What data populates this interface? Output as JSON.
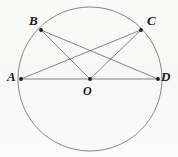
{
  "figure": {
    "kind": "geometry-diagram",
    "width": 178,
    "height": 157,
    "background_color": "#fbfbfa",
    "stroke_color": "#6e6e72",
    "point_color": "#1a1a1d",
    "label_color": "#17171a"
  },
  "labels": {
    "A": "A",
    "B": "B",
    "C": "C",
    "D": "D",
    "O": "O"
  },
  "chart_data": {
    "type": "diagram",
    "title": "",
    "shape": "circle",
    "circle": {
      "center": {
        "x": 90,
        "y": 79
      },
      "radius": 72,
      "cx": 90,
      "cy": 79,
      "r": 72
    },
    "points": [
      {
        "name": "A",
        "x": 21,
        "y": 79,
        "label_dx": -14,
        "label_dy": -9,
        "on_circle": true
      },
      {
        "name": "B",
        "x": 41,
        "y": 30,
        "label_dx": -12,
        "label_dy": -16,
        "on_circle": true
      },
      {
        "name": "C",
        "x": 141,
        "y": 30,
        "label_dx": 6,
        "label_dy": -16,
        "on_circle": true
      },
      {
        "name": "D",
        "x": 158,
        "y": 79,
        "label_dx": 3,
        "label_dy": -9,
        "on_circle": true
      },
      {
        "name": "O",
        "x": 90,
        "y": 79,
        "label_dx": -7,
        "label_dy": 6,
        "on_circle": false
      }
    ],
    "segments": [
      {
        "name": "AD",
        "from": "A",
        "to": "D",
        "role": "diameter"
      },
      {
        "name": "BO",
        "from": "B",
        "to": "O",
        "role": "radius"
      },
      {
        "name": "BD",
        "from": "B",
        "to": "D",
        "role": "chord"
      },
      {
        "name": "CO",
        "from": "C",
        "to": "O",
        "role": "radius"
      },
      {
        "name": "CA",
        "from": "C",
        "to": "A",
        "role": "chord"
      }
    ],
    "xlabel": "",
    "ylabel": "",
    "legend": []
  }
}
